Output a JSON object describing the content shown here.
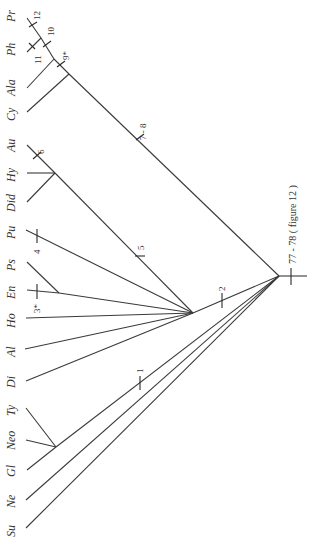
{
  "diagram": {
    "type": "cladogram",
    "orientation": "rotated-90",
    "root_label": "77 - 78 ( figure 12 )",
    "taxa": [
      {
        "id": "Pr",
        "label": "Pr"
      },
      {
        "id": "Ph",
        "label": "Ph"
      },
      {
        "id": "Ala",
        "label": "Ala"
      },
      {
        "id": "Cy",
        "label": "Cy"
      },
      {
        "id": "Au",
        "label": "Au"
      },
      {
        "id": "Hy",
        "label": "Hy"
      },
      {
        "id": "Did",
        "label": "Did"
      },
      {
        "id": "Pu",
        "label": "Pu"
      },
      {
        "id": "Ps",
        "label": "Ps"
      },
      {
        "id": "En",
        "label": "En"
      },
      {
        "id": "Ho",
        "label": "Ho"
      },
      {
        "id": "Al",
        "label": "Al"
      },
      {
        "id": "Di",
        "label": "Di"
      },
      {
        "id": "Ty",
        "label": "Ty"
      },
      {
        "id": "Neo",
        "label": "Neo"
      },
      {
        "id": "Gl",
        "label": "Gl"
      },
      {
        "id": "Ne",
        "label": "Ne"
      },
      {
        "id": "Su",
        "label": "Su"
      }
    ],
    "characters": [
      {
        "id": "c1",
        "label": "1"
      },
      {
        "id": "c2",
        "label": "2"
      },
      {
        "id": "c3",
        "label": "3*"
      },
      {
        "id": "c4",
        "label": "4"
      },
      {
        "id": "c5",
        "label": "5"
      },
      {
        "id": "c6",
        "label": "6"
      },
      {
        "id": "c7_8",
        "label": "7 - 8"
      },
      {
        "id": "c9",
        "label": "9*"
      },
      {
        "id": "c10",
        "label": "10"
      },
      {
        "id": "c11",
        "label": "11"
      },
      {
        "id": "c12",
        "label": "12"
      }
    ],
    "colors": {
      "line": "#3a3a3a",
      "text": "#333333",
      "background": "#ffffff"
    }
  }
}
